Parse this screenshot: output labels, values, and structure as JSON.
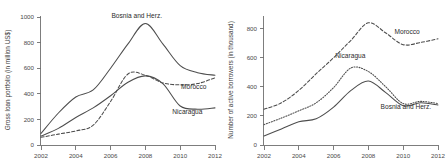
{
  "figure": {
    "background": "#ffffff",
    "line_color": "#4d4d4d",
    "axis_color": "#6f6f6f",
    "text_color": "#2b2b2b"
  },
  "chart_data": [
    {
      "type": "line",
      "panel": "left",
      "title": "",
      "xlabel": "",
      "ylabel": "Gross loan portfolio (in million US$)",
      "x": [
        2002,
        2003,
        2004,
        2005,
        2006,
        2007,
        2008,
        2009,
        2010,
        2011,
        2012
      ],
      "xlim": [
        2002,
        2012
      ],
      "ylim": [
        0,
        1000
      ],
      "xticks": [
        2002,
        2004,
        2006,
        2008,
        2010,
        2012
      ],
      "xticklabels": [
        "2002",
        "2004",
        "2006",
        "2008",
        "2010",
        "2012"
      ],
      "yticks": [
        0,
        200,
        400,
        600,
        800,
        1000
      ],
      "yticklabels": [
        "0",
        "200",
        "400",
        "600",
        "800",
        "1000"
      ],
      "grid": false,
      "legend_position": "inline-annotations",
      "series": [
        {
          "name": "Bosnia and Herz.",
          "style": "solid",
          "label_x": 2006.05,
          "label_y": 995,
          "values": [
            90,
            250,
            375,
            430,
            600,
            790,
            950,
            790,
            620,
            565,
            545
          ]
        },
        {
          "name": "Morocco",
          "style": "dashed",
          "label_x": 2010.05,
          "label_y": 440,
          "values": [
            60,
            85,
            110,
            155,
            340,
            555,
            545,
            485,
            470,
            480,
            525
          ]
        },
        {
          "name": "Nicaragua",
          "style": "solid",
          "label_x": 2009.55,
          "label_y": 245,
          "values": [
            70,
            130,
            215,
            290,
            385,
            490,
            540,
            480,
            305,
            280,
            290
          ]
        }
      ]
    },
    {
      "type": "line",
      "panel": "right",
      "title": "",
      "xlabel": "",
      "ylabel": "Number of active borrowers (in thousand)",
      "x": [
        2002,
        2003,
        2004,
        2005,
        2006,
        2007,
        2008,
        2009,
        2010,
        2011,
        2012
      ],
      "xlim": [
        2002,
        2012
      ],
      "ylim": [
        0,
        880
      ],
      "xticks": [
        2002,
        2004,
        2006,
        2008,
        2010,
        2012
      ],
      "xticklabels": [
        "2002",
        "2004",
        "2006",
        "2008",
        "2010",
        "2012"
      ],
      "yticks": [
        0,
        200,
        400,
        600,
        800
      ],
      "yticklabels": [
        "0",
        "200",
        "400",
        "600",
        "800"
      ],
      "grid": false,
      "legend_position": "inline-annotations",
      "series": [
        {
          "name": "Morocco",
          "style": "dashed",
          "label_x": 2009.5,
          "label_y": 760,
          "values": [
            245,
            290,
            375,
            490,
            600,
            720,
            840,
            770,
            690,
            705,
            730
          ]
        },
        {
          "name": "Nicaragua",
          "style": "dotted",
          "label_x": 2006.1,
          "label_y": 595,
          "values": [
            140,
            185,
            235,
            290,
            395,
            530,
            505,
            400,
            285,
            300,
            285
          ]
        },
        {
          "name": "Bosnia and Herz.",
          "style": "solid",
          "label_x": 2008.7,
          "label_y": 250,
          "values": [
            62,
            110,
            160,
            180,
            260,
            375,
            440,
            360,
            270,
            290,
            275
          ]
        }
      ]
    }
  ]
}
